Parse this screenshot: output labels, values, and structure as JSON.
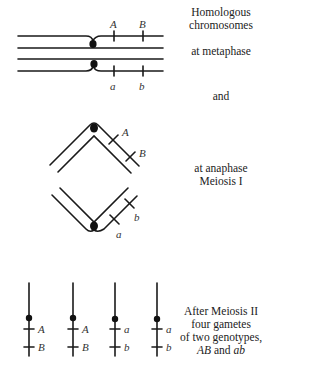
{
  "captions": {
    "metaphase": {
      "line1": "Homologous",
      "line2": "chromosomes",
      "line3": "at metaphase"
    },
    "connector": "and",
    "anaphase": {
      "line1": "at anaphase",
      "line2": "Meiosis I"
    },
    "meiosis2": {
      "line1": "After Meiosis II",
      "line2": "four gametes",
      "line3": "of two genotypes,",
      "line4_part1": "AB",
      "line4_part2": " and ",
      "line4_part3": "ab"
    }
  },
  "labels": {
    "metaphase": {
      "top_A": "A",
      "top_B": "B",
      "bottom_a": "a",
      "bottom_b": "b"
    },
    "anaphase": {
      "upper_A": "A",
      "upper_B": "B",
      "lower_a": "a",
      "lower_b": "b"
    },
    "gametes": [
      {
        "locus1": "A",
        "locus2": "B"
      },
      {
        "locus1": "A",
        "locus2": "B"
      },
      {
        "locus1": "a",
        "locus2": "b"
      },
      {
        "locus1": "a",
        "locus2": "b"
      }
    ]
  }
}
